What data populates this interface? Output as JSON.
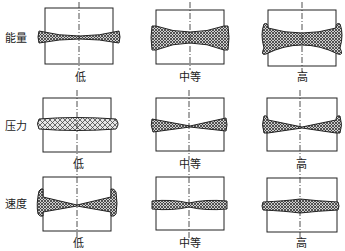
{
  "figure": {
    "rows": [
      {
        "label": "能量"
      },
      {
        "label": "压力"
      },
      {
        "label": "速度"
      }
    ],
    "columns": [
      {
        "label": "低"
      },
      {
        "label": "中等"
      },
      {
        "label": "高"
      }
    ],
    "colors": {
      "stroke": "#222222",
      "hatch": "#555555",
      "background": "#ffffff"
    }
  }
}
